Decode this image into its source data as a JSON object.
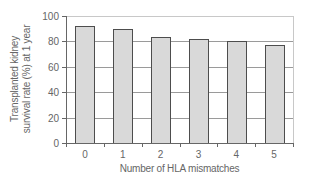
{
  "chart_data": {
    "type": "bar",
    "title": "",
    "xlabel": "Number of HLA mismatches",
    "ylabel": "Transplanted kidney survival rate (%) at 1 year",
    "ylabel_lines": [
      "Transplanted kidney",
      "survival rate (%) at 1 year"
    ],
    "categories": [
      "0",
      "1",
      "2",
      "3",
      "4",
      "5"
    ],
    "values": [
      92.5,
      89.5,
      83.5,
      82,
      80.5,
      77
    ],
    "ylim": [
      0,
      100
    ],
    "yticks": [
      0,
      20,
      40,
      60,
      80,
      100
    ],
    "grid": true,
    "legend": null
  },
  "colors": {
    "bar_fill": "#d9d9d9",
    "bar_stroke": "#4d4d4d",
    "grid": "#9a9a9a",
    "frame": "#c8c8c8",
    "axis": "#666666"
  }
}
